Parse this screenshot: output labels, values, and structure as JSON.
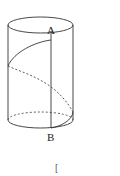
{
  "diagram": {
    "type": "cylinder-helix",
    "labels": {
      "top_point": "A",
      "bottom_point": "B"
    },
    "footer_fragment": "[",
    "colors": {
      "stroke": "#333333",
      "background": "#ffffff"
    }
  }
}
